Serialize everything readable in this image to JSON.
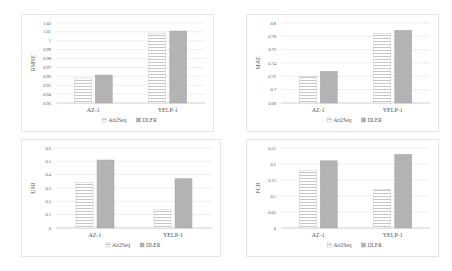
{
  "chart_data": [
    {
      "type": "bar",
      "title": "",
      "xlabel": "",
      "ylabel": "RMSE",
      "categories": [
        "AZ-1",
        "YELP-1"
      ],
      "series": [
        {
          "name": "Att2Seq",
          "values": [
            0.958,
            1.0085
          ]
        },
        {
          "name": "DLER",
          "values": [
            0.9615,
            1.011
          ]
        }
      ],
      "ylim": [
        0.93,
        1.02
      ],
      "yticks": [
        0.93,
        0.94,
        0.95,
        0.96,
        0.97,
        0.98,
        0.99,
        1,
        1.01,
        1.02
      ],
      "ytick_labels": [
        "0.93",
        "0.94",
        "0.95",
        "0.96",
        "0.97",
        "0.98",
        "0.99",
        "1",
        "1.01",
        "1.02"
      ],
      "grid": true,
      "legend": "bottom"
    },
    {
      "type": "bar",
      "title": "",
      "xlabel": "",
      "ylabel": "MAE",
      "categories": [
        "AZ-1",
        "YELP-1"
      ],
      "series": [
        {
          "name": "Att2Seq",
          "values": [
            0.7195,
            0.784
          ]
        },
        {
          "name": "DLER",
          "values": [
            0.7275,
            0.789
          ]
        }
      ],
      "ylim": [
        0.68,
        0.8
      ],
      "yticks": [
        0.68,
        0.7,
        0.72,
        0.74,
        0.76,
        0.78,
        0.8
      ],
      "ytick_labels": [
        "0.68",
        "0.7",
        "0.72",
        "0.74",
        "0.76",
        "0.78",
        "0.8"
      ],
      "grid": true,
      "legend": "bottom"
    },
    {
      "type": "bar",
      "title": "",
      "xlabel": "",
      "ylabel": "USR",
      "categories": [
        "AZ-1",
        "YELP-1"
      ],
      "series": [
        {
          "name": "Att2Seq",
          "values": [
            0.34,
            0.14
          ]
        },
        {
          "name": "DLER",
          "values": [
            0.51,
            0.37
          ]
        }
      ],
      "ylim": [
        0,
        0.6
      ],
      "yticks": [
        0,
        0.1,
        0.2,
        0.3,
        0.4,
        0.5,
        0.6
      ],
      "ytick_labels": [
        "0",
        "0.1",
        "0.2",
        "0.3",
        "0.4",
        "0.5",
        "0.6"
      ],
      "grid": true,
      "legend": "bottom"
    },
    {
      "type": "bar",
      "title": "",
      "xlabel": "",
      "ylabel": "FCR",
      "categories": [
        "AZ-1",
        "YELP-1"
      ],
      "series": [
        {
          "name": "Att2Seq",
          "values": [
            0.18,
            0.12
          ]
        },
        {
          "name": "DLER",
          "values": [
            0.21,
            0.23
          ]
        }
      ],
      "ylim": [
        0,
        0.25
      ],
      "yticks": [
        0,
        0.05,
        0.1,
        0.15,
        0.2,
        0.25
      ],
      "ytick_labels": [
        "0",
        "0.05",
        "0.1",
        "0.15",
        "0.2",
        "0.25"
      ],
      "grid": true,
      "legend": "bottom"
    }
  ]
}
